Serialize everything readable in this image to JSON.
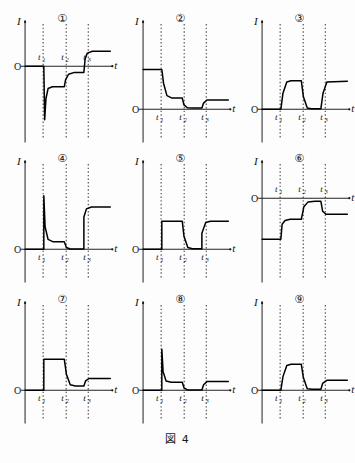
{
  "figure": {
    "caption": "図 4",
    "axis_y_label": "I",
    "axis_x_label": "t",
    "origin_label": "O",
    "tick_labels": [
      "t",
      "t",
      "t"
    ],
    "tick_subscripts": [
      "1",
      "2",
      "3"
    ]
  },
  "chart_data": {
    "type": "line",
    "title": "図 4",
    "xlabel": "t",
    "ylabel": "I",
    "grid": true,
    "legend": "none",
    "xlim": [
      0,
      10
    ],
    "ylim": [
      -10,
      10
    ],
    "shared_x_ticks": [
      2.2,
      4.6,
      6.9
    ],
    "shared_x_ticklabels": [
      "t1",
      "t2",
      "t3"
    ],
    "panels": [
      {
        "id": "1",
        "label": "①",
        "description": "Zero until t1, sharp negative spike, partial recovery to negative plateau, step up at t2 to small negative plateau, rise above axis after t3",
        "x": [
          0,
          2.2,
          2.3,
          2.45,
          2.7,
          3.2,
          4.6,
          4.75,
          5.1,
          5.8,
          6.9,
          7.05,
          7.3,
          7.9,
          10
        ],
        "y": [
          0,
          0,
          -8.6,
          -5.2,
          -3.6,
          -3.3,
          -3.3,
          -2.2,
          -1.3,
          -1.0,
          -1.0,
          1.2,
          2.1,
          2.4,
          2.4
        ]
      },
      {
        "id": "2",
        "label": "②",
        "description": "High positive plateau, decay at t1 to mid plateau, decay at t2 to near zero, small rise after t3",
        "x": [
          0,
          2.2,
          2.4,
          2.8,
          3.4,
          4.6,
          4.8,
          5.2,
          5.8,
          6.9,
          7.1,
          7.5,
          10
        ],
        "y": [
          6.4,
          6.4,
          4.2,
          2.2,
          1.8,
          1.8,
          0.7,
          0.25,
          0.2,
          0.2,
          1.0,
          1.5,
          1.5
        ]
      },
      {
        "id": "3",
        "label": "③",
        "description": "Zero, rise at t1 to plateau, fall at t2 to zero, rise at t3 to plateau",
        "x": [
          0,
          2.2,
          2.45,
          2.9,
          3.4,
          4.6,
          4.85,
          5.3,
          5.8,
          6.9,
          7.15,
          7.6,
          10
        ],
        "y": [
          0,
          0,
          2.6,
          4.4,
          4.6,
          4.6,
          2.0,
          0.2,
          0.1,
          0.1,
          2.6,
          4.4,
          4.5
        ]
      },
      {
        "id": "4",
        "label": "④",
        "description": "Zero, vertical spike up at t1 decaying to low plateau, small dip at t2, vertical jump at t3 to high plateau",
        "x": [
          0,
          2.2,
          2.2,
          2.35,
          2.7,
          3.3,
          4.6,
          4.85,
          5.3,
          6.0,
          6.9,
          6.9,
          7.2,
          7.8,
          10
        ],
        "y": [
          0,
          0,
          8.6,
          3.6,
          1.6,
          1.2,
          1.2,
          0.3,
          0.05,
          0.05,
          0.05,
          5.2,
          6.5,
          6.8,
          6.8
        ]
      },
      {
        "id": "5",
        "label": "⑤",
        "description": "Zero, vertical step up at t1 to plateau, exponential decay at t2 to zero, vertical rise at t3 back to plateau",
        "x": [
          0,
          2.2,
          2.2,
          4.6,
          4.8,
          5.25,
          5.8,
          6.9,
          6.9,
          7.35,
          7.9,
          10
        ],
        "y": [
          0,
          0,
          4.5,
          4.5,
          2.1,
          0.3,
          0.1,
          0.1,
          2.6,
          4.3,
          4.5,
          4.5
        ]
      },
      {
        "id": "6",
        "label": "⑥",
        "description": "Low negative plateau, sharp rise at t1 to mid negative plateau, rise at t2 to just below axis, drop after t3 to lower plateau",
        "x": [
          0,
          2.2,
          2.35,
          2.7,
          3.3,
          4.6,
          4.9,
          5.4,
          6.2,
          6.9,
          7.1,
          7.5,
          10
        ],
        "y": [
          -6.6,
          -6.6,
          -4.2,
          -3.6,
          -3.4,
          -3.4,
          -1.4,
          -0.6,
          -0.5,
          -0.5,
          -2.1,
          -2.6,
          -2.6
        ]
      },
      {
        "id": "7",
        "label": "⑦",
        "description": "Zero, vertical step up at t1 to plateau, decay at t2 to low plateau, small rise at t3",
        "x": [
          0,
          2.2,
          2.2,
          4.6,
          4.85,
          5.3,
          5.9,
          6.9,
          7.1,
          7.5,
          10
        ],
        "y": [
          0,
          0,
          5.0,
          5.0,
          2.6,
          0.9,
          0.7,
          0.7,
          1.5,
          1.9,
          1.9
        ]
      },
      {
        "id": "8",
        "label": "⑧",
        "description": "Zero, vertical spike up at t1 decaying to low plateau, drop at t2 to near zero, small rise at t3",
        "x": [
          0,
          2.2,
          2.2,
          2.35,
          2.7,
          3.3,
          4.6,
          4.8,
          5.2,
          5.9,
          6.9,
          7.1,
          7.5,
          10
        ],
        "y": [
          0,
          0,
          6.6,
          3.0,
          1.5,
          1.3,
          1.3,
          0.4,
          0.05,
          0.05,
          0.05,
          0.9,
          1.4,
          1.4
        ]
      },
      {
        "id": "9",
        "label": "⑨",
        "description": "Zero, rise at t1 to plateau, fall at t2 to near zero, small rise at t3",
        "x": [
          0,
          2.2,
          2.45,
          2.9,
          3.4,
          4.6,
          4.85,
          5.3,
          5.9,
          6.9,
          7.1,
          7.6,
          10
        ],
        "y": [
          0,
          0,
          2.2,
          4.0,
          4.2,
          4.2,
          2.0,
          0.25,
          0.15,
          0.15,
          1.1,
          1.6,
          1.6
        ]
      }
    ]
  }
}
